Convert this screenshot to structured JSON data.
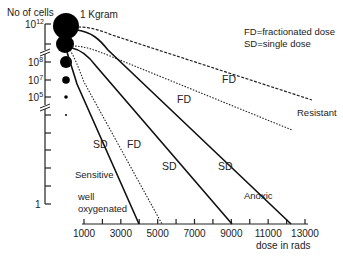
{
  "chart_data": {
    "type": "line",
    "title": "",
    "ylabel": "No of cells",
    "xlabel": "dose in rads",
    "x_ticks": [
      1000,
      2000,
      3000,
      4000,
      5000,
      6000,
      7000,
      8000,
      9000,
      10000,
      11000,
      12000,
      13000
    ],
    "x_tick_labels": [
      "1000",
      "3000",
      "5000",
      "7000",
      "9000",
      "11000",
      "13000"
    ],
    "x_labeled_values": [
      1000,
      3000,
      5000,
      7000,
      9000,
      11000,
      13000
    ],
    "xlim": [
      1000,
      13000
    ],
    "y_tick_labels": [
      {
        "base": "10",
        "exp": "12"
      },
      {
        "base": "10",
        "exp": "8"
      },
      {
        "base": "10",
        "exp": "7"
      },
      {
        "base": "10",
        "exp": "5"
      },
      {
        "base": "1",
        "exp": ""
      }
    ],
    "tumor_mass_label": "1 Kgram",
    "legend": [
      "FD=fractionated dose",
      "SD=single dose"
    ],
    "series": [
      {
        "name": "Resistant FD",
        "style": "dashed",
        "label": "FD",
        "end_dose": 13000,
        "end_note": "Resistant"
      },
      {
        "name": "FD (mid)",
        "style": "dotted",
        "label": "FD",
        "end_dose": 13000
      },
      {
        "name": "Anoxic SD",
        "style": "solid",
        "label": "SD",
        "end_dose": 10800,
        "end_note": "Anoxic"
      },
      {
        "name": "SD (mid)",
        "style": "solid",
        "label": "SD",
        "end_dose": 9000
      },
      {
        "name": "Sensitive FD",
        "style": "dotted",
        "label": "FD",
        "end_dose": 5200
      },
      {
        "name": "Sensitive SD",
        "style": "solid",
        "label": "SD",
        "end_dose": 4000,
        "end_note": "Sensitive"
      }
    ],
    "annotations": [
      "Resistant",
      "Anoxic",
      "Sensitive",
      "well",
      "oxygenated"
    ]
  }
}
